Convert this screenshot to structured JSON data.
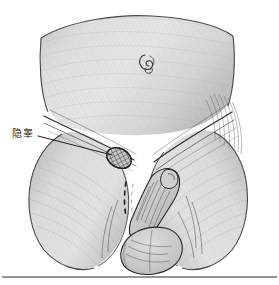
{
  "figure": {
    "type": "medical-anatomical-illustration",
    "view": "anterior",
    "style": "grayscale-pencil-shaded-line-drawing",
    "background_color": "#ffffff",
    "ink_color": "#1c1c1c",
    "skin_fill_light": "#e4e4e4",
    "skin_fill_mid": "#d2d2d2",
    "skin_fill_dark": "#bdbdbd",
    "shadow_color": "#a9a9a9",
    "hatch_color": "#4a4a4a"
  },
  "annotations": {
    "callouts": [
      {
        "id": "cryptorchidism",
        "label": "隐睾",
        "meaning": "undescended testis",
        "label_position": {
          "x": 12,
          "y": 128
        },
        "leader_from": {
          "x": 38,
          "y": 136
        },
        "leader_to": {
          "x": 112,
          "y": 155
        },
        "target": "hatched-oval-mass-left-inguinal-canal"
      }
    ]
  },
  "anatomy_parts": [
    {
      "name": "abdominal-wall",
      "description": "lower abdomen panel"
    },
    {
      "name": "umbilicus",
      "description": "navel marking",
      "position": {
        "x": 148,
        "y": 62
      }
    },
    {
      "name": "inguinal-fold-left",
      "description": "left groin crease line"
    },
    {
      "name": "inguinal-fold-right",
      "description": "right groin crease line"
    },
    {
      "name": "undescended-testis",
      "description": "hatched oval mass in left inguinal canal",
      "position": {
        "x": 119,
        "y": 158
      }
    },
    {
      "name": "descent-path-dashed",
      "description": "dashed line indicating normal testicular descent route"
    },
    {
      "name": "penis",
      "description": "external genitalia shaft"
    },
    {
      "name": "scrotum",
      "description": "empty scrotal sac"
    },
    {
      "name": "thigh-left",
      "description": "left upper thigh"
    },
    {
      "name": "thigh-right",
      "description": "right upper thigh"
    }
  ],
  "footer": {
    "rule_y": 277,
    "rule_color": "#2b2b2b"
  }
}
